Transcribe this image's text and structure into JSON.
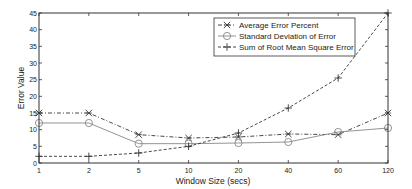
{
  "chart_data": {
    "type": "line",
    "title": "",
    "xlabel": "Window Size (secs)",
    "ylabel": "Error Value",
    "x": [
      1,
      2,
      5,
      10,
      20,
      40,
      60,
      120
    ],
    "categories": [
      "1",
      "2",
      "5",
      "10",
      "20",
      "40",
      "60",
      "120"
    ],
    "ylim": [
      0,
      45
    ],
    "yticks": [
      0,
      5,
      10,
      15,
      20,
      25,
      30,
      35,
      40,
      45
    ],
    "grid": false,
    "legend_position": "upper right (inset)",
    "series": [
      {
        "name": "Average Error Percent",
        "marker": "x-star",
        "line_style": "dash-dot",
        "values": [
          15,
          15,
          8.5,
          7.5,
          7.8,
          8.7,
          8.5,
          15
        ]
      },
      {
        "name": "Standard Deviation of Error",
        "marker": "circle",
        "line_style": "solid",
        "values": [
          12,
          12,
          5.8,
          5.8,
          6,
          6.3,
          9.3,
          10.5
        ]
      },
      {
        "name": "Sum of Root Mean Square Error",
        "marker": "plus",
        "line_style": "dashed",
        "values": [
          2,
          2,
          3,
          5,
          9,
          16.5,
          25.5,
          45
        ]
      }
    ]
  },
  "legend": {
    "items": [
      {
        "label": "Average Error Percent"
      },
      {
        "label": "Standard Deviation of Error"
      },
      {
        "label": "Sum of Root Mean Square Error"
      }
    ]
  },
  "axes": {
    "xlabel": "Window Size (secs)",
    "ylabel": "Error Value"
  }
}
